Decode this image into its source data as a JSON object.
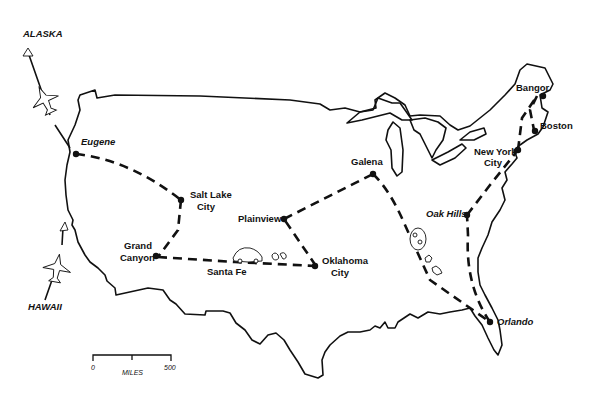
{
  "map": {
    "title": "US travel route map",
    "external_destinations": [
      {
        "id": "alaska",
        "label": "ALASKA"
      },
      {
        "id": "hawaii",
        "label": "HAWAII"
      }
    ],
    "cities": [
      {
        "id": "eugene",
        "label": "Eugene"
      },
      {
        "id": "salt-lake-city",
        "line1": "Salt Lake",
        "line2": "City"
      },
      {
        "id": "grand-canyon",
        "line1": "Grand",
        "line2": "Canyon"
      },
      {
        "id": "santa-fe",
        "label": "Santa Fe"
      },
      {
        "id": "plainview",
        "label": "Plainview"
      },
      {
        "id": "oklahoma-city",
        "line1": "Oklahoma",
        "line2": "City"
      },
      {
        "id": "galena",
        "label": "Galena"
      },
      {
        "id": "oak-hills",
        "label": "Oak Hills"
      },
      {
        "id": "orlando",
        "label": "Orlando"
      },
      {
        "id": "new-york-city",
        "line1": "New York",
        "line2": "City"
      },
      {
        "id": "bangor",
        "label": "Bangor"
      },
      {
        "id": "boston",
        "label": "Boston"
      }
    ],
    "scale": {
      "start": "0",
      "end": "500",
      "unit": "MILES"
    },
    "colors": {
      "ink": "#111111",
      "background": "#ffffff"
    }
  }
}
